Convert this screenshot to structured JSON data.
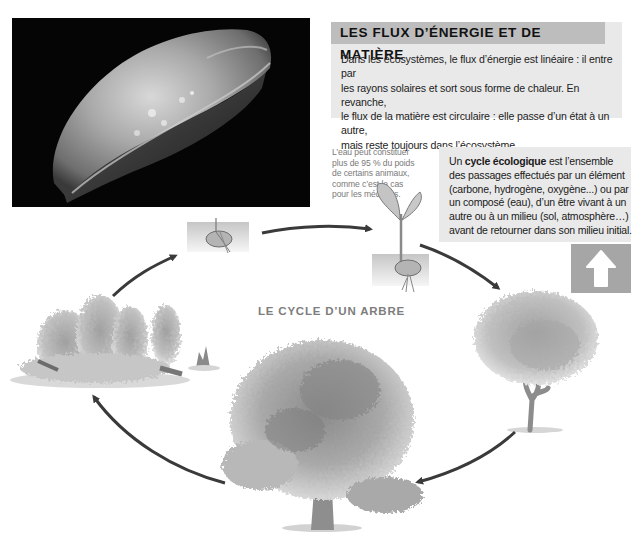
{
  "photo": {
    "subject": "jellyfish",
    "background_color": "#050505"
  },
  "flux_box": {
    "title": "LES FLUX D’ÉNERGIE ET DE MATIÈRE",
    "lines": [
      "Dans les écosystèmes, le flux d’énergie est linéaire : il entre par",
      "les rayons solaires et sort sous forme de chaleur. En revanche,",
      "le flux de la matière est circulaire : elle passe d’un état à un autre,",
      "mais reste toujours dans l’écosystème."
    ],
    "header_color": "#bdbdbd",
    "body_color": "#e9e9e9"
  },
  "side_note": {
    "lines": [
      "L’eau peut constituer",
      "plus de 95 % du poids",
      "de certains animaux,",
      "comme c’est le cas",
      "pour les méduses."
    ]
  },
  "cycle_box": {
    "intro": "Un ",
    "term": "cycle écologique",
    "line1_rest": " est l’ensemble",
    "lines": [
      "des passages effectués par un élément",
      "(carbone, hydrogène, oxygène...) ou par",
      "un composé (eau), d’un être vivant à un",
      "autre ou à un milieu (sol, atmosphère…)",
      "avant de retourner dans son milieu initial."
    ],
    "arrow_icon": "up-arrow-icon",
    "arrow_box_color": "#a6a6a6"
  },
  "diagram": {
    "title": "LE CYCLE D’UN ARBRE",
    "stages": [
      {
        "name": "seed-in-soil"
      },
      {
        "name": "seedling"
      },
      {
        "name": "young-tree"
      },
      {
        "name": "mature-tree"
      },
      {
        "name": "decaying-forest"
      }
    ],
    "arrow_color": "#3a3a3a"
  }
}
